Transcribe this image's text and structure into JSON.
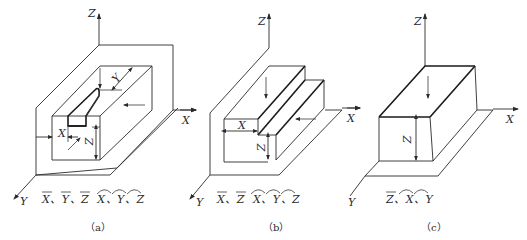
{
  "figure": {
    "panels": [
      {
        "id": "a",
        "caption": "（a）",
        "axes": {
          "z": "Z",
          "x": "X",
          "y": "Y"
        },
        "dimensions": {
          "x": "X",
          "y": "Y",
          "z": "Z"
        },
        "constraints_text": "X͞、Y͞、Z͞ X͡、Y͡、Z͡",
        "translations": [
          "X",
          "Y",
          "Z"
        ],
        "rotations": [
          "X",
          "Y",
          "Z"
        ],
        "feature": "enclosed slot (keyway) in block"
      },
      {
        "id": "b",
        "caption": "（b）",
        "axes": {
          "z": "Z",
          "x": "X",
          "y": "Y"
        },
        "dimensions": {
          "x": "X",
          "z": "Z"
        },
        "constraints_text": "X͞、Z͞ X͡、Y͡、Z͡",
        "translations": [
          "X",
          "Z"
        ],
        "rotations": [
          "X",
          "Y",
          "Z"
        ],
        "feature": "through step"
      },
      {
        "id": "c",
        "caption": "（c）",
        "axes": {
          "z": "Z",
          "x": "X",
          "y": "Y"
        },
        "dimensions": {
          "z": "Z"
        },
        "constraints_text": "Z͞、X͡、Y͡",
        "translations": [
          "Z"
        ],
        "rotations": [
          "X",
          "Y"
        ],
        "feature": "top plane"
      }
    ],
    "colors": {
      "line": "#2a2a2a",
      "background": "#ffffff"
    }
  }
}
